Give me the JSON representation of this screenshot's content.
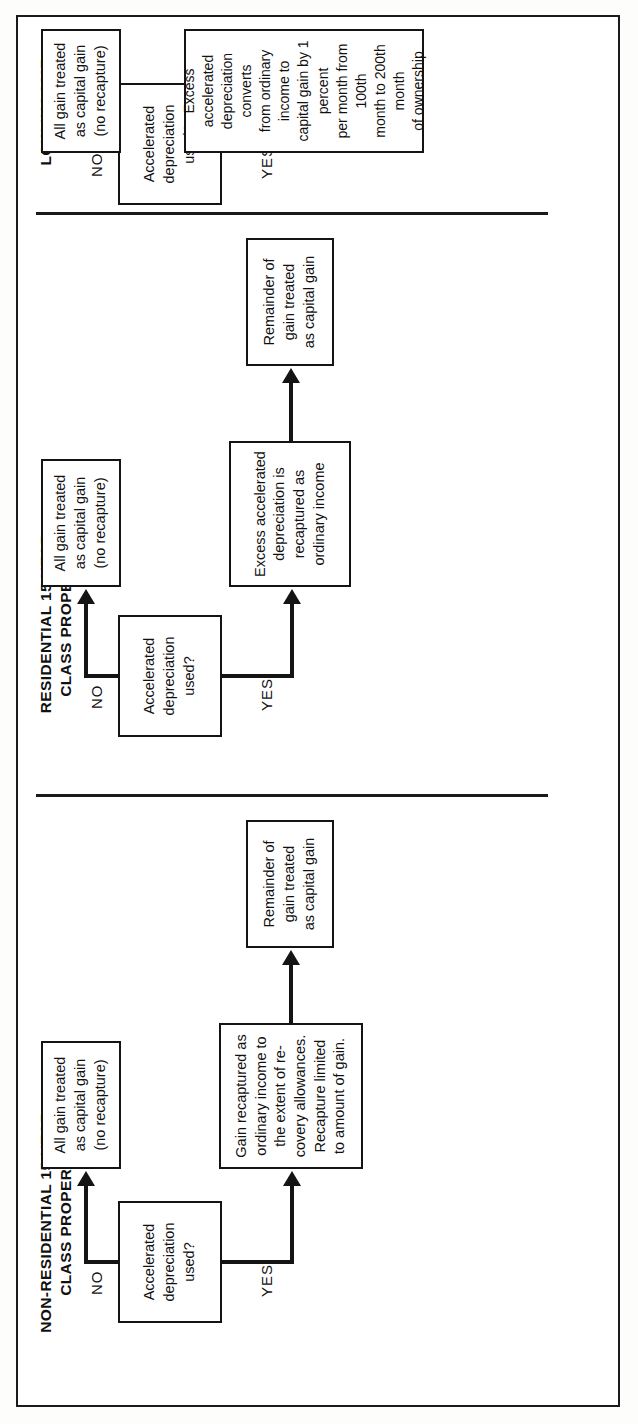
{
  "document": {
    "type": "flowchart",
    "orientation": "rotated-90-counterclockwise",
    "frame_color": "#1a1a1a",
    "background_color": "#ffffff"
  },
  "sections": [
    {
      "id": "non-residential",
      "title": "NON-RESIDENTIAL 15-YEAR\nCLASS PROPERTY",
      "decision": "Accelerated\ndepreciation\nused?",
      "branches": {
        "no_label": "NO",
        "yes_label": "YES"
      },
      "no_outcome": "All gain treated\nas capital gain\n(no recapture)",
      "yes_outcome": "Gain recaptured as\nordinary income to\nthe extent of re-\ncovery allowances.\nRecapture limited\nto amount of gain.",
      "final_outcome": "Remainder of\ngain treated\nas capital gain"
    },
    {
      "id": "residential",
      "title": "RESIDENTIAL 15-YEAR\nCLASS PROPERTY",
      "decision": "Accelerated\ndepreciation\nused?",
      "branches": {
        "no_label": "NO",
        "yes_label": "YES"
      },
      "no_outcome": "All gain treated\nas capital gain\n(no recapture)",
      "yes_outcome": "Excess accelerated\ndepreciation is\nrecaptured as\nordinary income",
      "final_outcome": "Remainder of\ngain treated\nas capital gain"
    },
    {
      "id": "low-income-housing",
      "title": "LOW-INCOME\nHOUSING",
      "decision": "Accelerated\ndepreciation\nused?",
      "branches": {
        "no_label": "NO",
        "yes_label": "YES"
      },
      "no_outcome": "All gain treated\nas capital gain\n(no recapture)",
      "yes_outcome": "Excess accelerated\ndepreciation converts\nfrom ordinary income to\ncapital gain by 1 percent\nper month from 100th\nmonth to 200th month\nof ownership",
      "final_outcome": null
    }
  ]
}
